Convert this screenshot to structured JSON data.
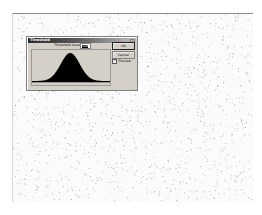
{
  "canvas": {
    "description": "speckled noise image",
    "background": "#fbfbfb",
    "speckle_color": "#9a9a9a"
  },
  "dialog": {
    "title": "Threshold",
    "close_glyph": "×",
    "threshold_label": "Threshold Level:",
    "threshold_value": "128",
    "ok_label": "OK",
    "cancel_label": "Cancel",
    "preview_label": "Preview",
    "preview_checked": true,
    "check_glyph": "✓",
    "histogram": {
      "shape": "gaussian",
      "peak_position_fraction": 0.49,
      "fill": "#000000",
      "background": "#d4d0c8"
    }
  }
}
